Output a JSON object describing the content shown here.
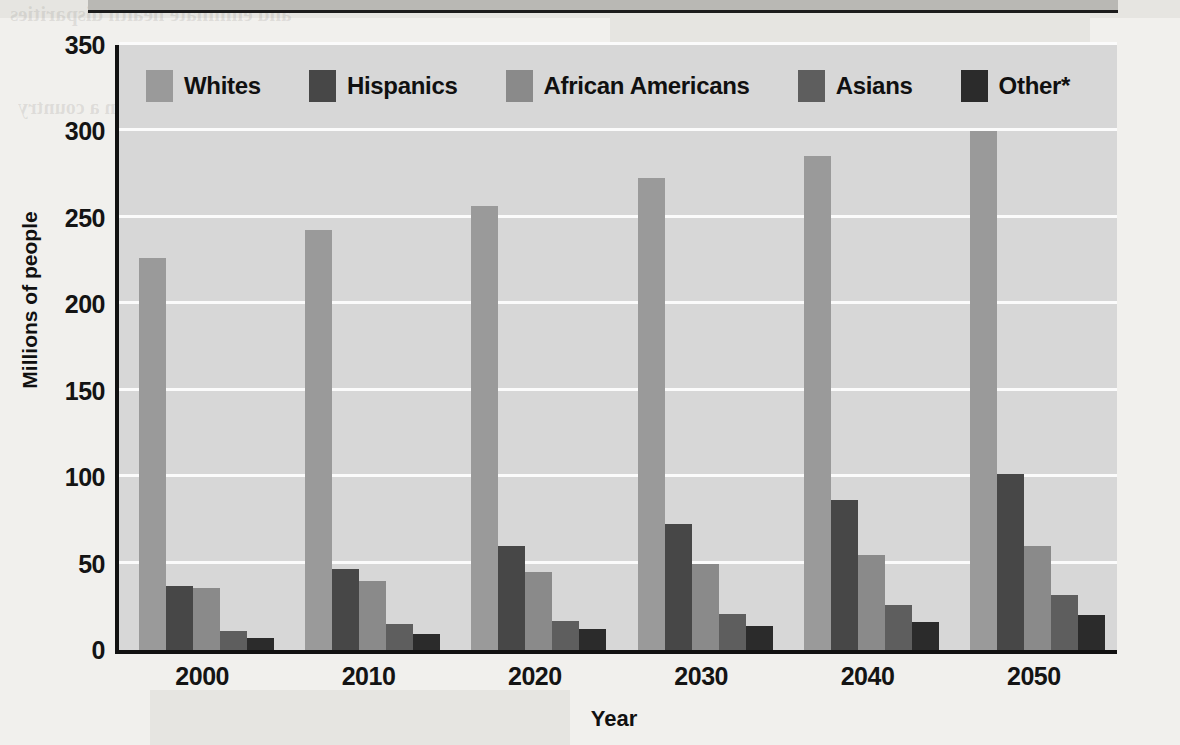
{
  "page": {
    "background_color": "#f1f0ed",
    "bleed_through_lines": [
      "and eliminate health disparities",
      "of people in a country",
      "the population will continue",
      "these changes affect the way",
      "diverse groups and the needs",
      "programs must be designed"
    ]
  },
  "chart_data": {
    "type": "bar",
    "title": "",
    "subtitle": "",
    "xlabel": "Year",
    "ylabel": "Millions of people",
    "categories": [
      "2000",
      "2010",
      "2020",
      "2030",
      "2040",
      "2050"
    ],
    "ylim": [
      0,
      350
    ],
    "yticks": [
      0,
      50,
      100,
      150,
      200,
      250,
      300,
      350
    ],
    "ytick_labels": [
      "0",
      "50",
      "100",
      "150",
      "200",
      "250",
      "300",
      "350"
    ],
    "grid": true,
    "grid_color": "#fbfbfb",
    "legend_position": "top-inside",
    "plot_background": "#d7d7d7",
    "series": [
      {
        "name": "Whites",
        "color": "#9a9a9a",
        "values": [
          227,
          243,
          257,
          273,
          286,
          300
        ]
      },
      {
        "name": "Hispanics",
        "color": "#474747",
        "values": [
          37,
          47,
          60,
          73,
          87,
          102
        ]
      },
      {
        "name": "African Americans",
        "color": "#8a8a8a",
        "values": [
          36,
          40,
          45,
          50,
          55,
          60
        ]
      },
      {
        "name": "Asians",
        "color": "#5e5e5e",
        "values": [
          11,
          15,
          17,
          21,
          26,
          32
        ]
      },
      {
        "name": "Other*",
        "color": "#2b2b2b",
        "values": [
          7,
          9,
          12,
          14,
          16,
          20
        ]
      }
    ]
  },
  "legend": {
    "entries": [
      {
        "label": "Whites",
        "color": "#9a9a9a"
      },
      {
        "label": "Hispanics",
        "color": "#474747"
      },
      {
        "label": "African Americans",
        "color": "#8a8a8a"
      },
      {
        "label": "Asians",
        "color": "#5e5e5e"
      },
      {
        "label": "Other*",
        "color": "#2b2b2b"
      }
    ]
  }
}
